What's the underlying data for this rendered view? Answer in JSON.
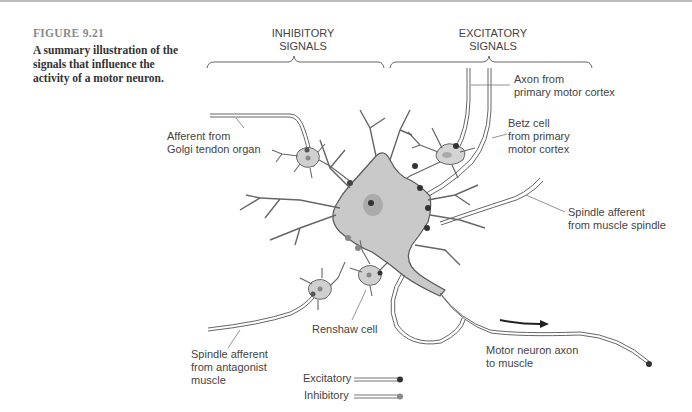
{
  "figure": {
    "number": "FIGURE 9.21",
    "caption": "A summary illustration of the signals that influence the activity of a motor neuron."
  },
  "headers": {
    "inhibitory": "INHIBITORY\nSIGNALS",
    "excitatory": "EXCITATORY\nSIGNALS"
  },
  "labels": {
    "axon_primary": "Axon from\nprimary motor cortex",
    "betz_cell": "Betz cell\nfrom primary\nmotor cortex",
    "golgi": "Afferent from\nGolgi tendon organ",
    "spindle_muscle": "Spindle afferent\nfrom muscle spindle",
    "spindle_antagonist": "Spindle afferent\nfrom antagonist\nmuscle",
    "renshaw": "Renshaw cell",
    "motor_axon": "Motor neuron axon\nto muscle"
  },
  "legend": {
    "excitatory": "Excitatory",
    "inhibitory": "Inhibitory"
  },
  "colors": {
    "cell_fill": "#c9c9c9",
    "outline": "#5a5a5a",
    "excitatory_terminal": "#3a3a3a",
    "inhibitory_terminal": "#8a8a8a"
  }
}
